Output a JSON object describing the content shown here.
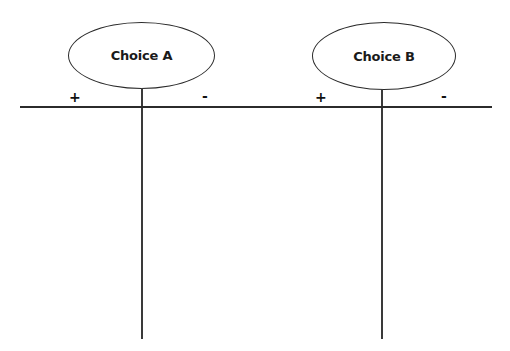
{
  "diagram": {
    "type": "t-chart-comparison",
    "choices": [
      {
        "label": "Choice A",
        "plus_label": "+",
        "minus_label": "-"
      },
      {
        "label": "Choice B",
        "plus_label": "+",
        "minus_label": "-"
      }
    ],
    "colors": {
      "line": "#2b2b2b",
      "text": "#1a1a1a",
      "background": "#ffffff"
    }
  }
}
